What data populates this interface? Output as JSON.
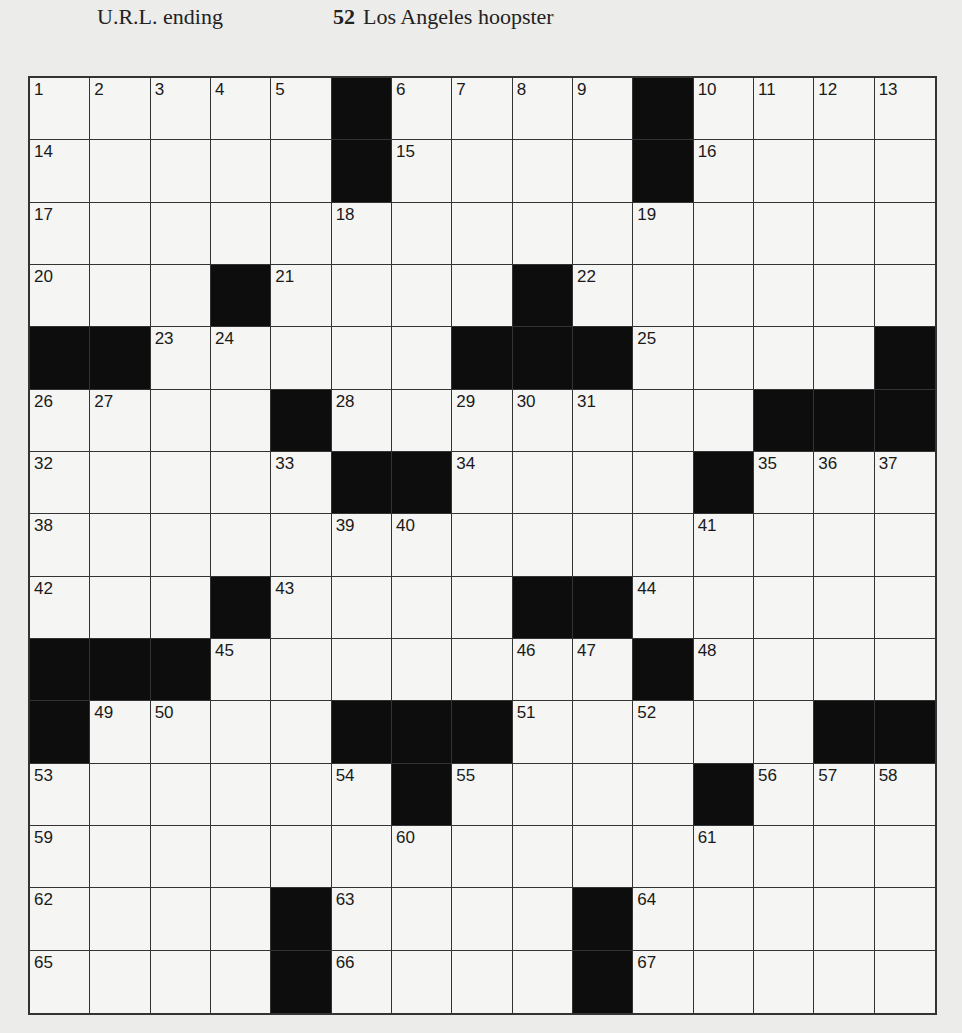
{
  "header": {
    "left_clue_text": "U.R.L. ending",
    "right_clue_number": "52",
    "right_clue_text": "Los Angeles hoopster"
  },
  "grid": {
    "rows": 15,
    "cols": 15,
    "layout": [
      ".....#....#....",
      ".....#....#....",
      "...............",
      "...#....#......",
      "##.....###.....#",
      "....#.......###",
      ".....##.....#...",
      "...............",
      "...#....##.....",
      "###.......#....",
      "#....###......##",
      "......#.....#...",
      "...............",
      "....#....#.....",
      "....#....#....."
    ],
    "numbers": [
      [
        1,
        2,
        3,
        4,
        5,
        0,
        6,
        7,
        8,
        9,
        0,
        10,
        11,
        12,
        13
      ],
      [
        14,
        0,
        0,
        0,
        0,
        0,
        15,
        0,
        0,
        0,
        0,
        16,
        0,
        0,
        0
      ],
      [
        17,
        0,
        0,
        0,
        0,
        18,
        0,
        0,
        0,
        0,
        19,
        0,
        0,
        0,
        0
      ],
      [
        20,
        0,
        0,
        0,
        21,
        0,
        0,
        0,
        0,
        22,
        0,
        0,
        0,
        0,
        0
      ],
      [
        0,
        0,
        23,
        24,
        0,
        0,
        0,
        0,
        0,
        0,
        25,
        0,
        0,
        0,
        0
      ],
      [
        26,
        27,
        0,
        0,
        0,
        28,
        0,
        29,
        30,
        31,
        0,
        0,
        0,
        0,
        0
      ],
      [
        32,
        0,
        0,
        0,
        33,
        0,
        0,
        34,
        0,
        0,
        0,
        0,
        35,
        36,
        37
      ],
      [
        38,
        0,
        0,
        0,
        0,
        39,
        40,
        0,
        0,
        0,
        0,
        41,
        0,
        0,
        0
      ],
      [
        42,
        0,
        0,
        0,
        43,
        0,
        0,
        0,
        0,
        0,
        44,
        0,
        0,
        0,
        0
      ],
      [
        0,
        0,
        0,
        45,
        0,
        0,
        0,
        0,
        46,
        47,
        0,
        48,
        0,
        0,
        0
      ],
      [
        0,
        49,
        50,
        0,
        0,
        0,
        0,
        0,
        51,
        0,
        52,
        0,
        0,
        0,
        0
      ],
      [
        53,
        0,
        0,
        0,
        0,
        54,
        0,
        55,
        0,
        0,
        0,
        0,
        56,
        57,
        58
      ],
      [
        59,
        0,
        0,
        0,
        0,
        0,
        60,
        0,
        0,
        0,
        0,
        61,
        0,
        0,
        0
      ],
      [
        62,
        0,
        0,
        0,
        0,
        63,
        0,
        0,
        0,
        0,
        64,
        0,
        0,
        0,
        0
      ],
      [
        65,
        0,
        0,
        0,
        0,
        66,
        0,
        0,
        0,
        0,
        67,
        0,
        0,
        0,
        0
      ]
    ]
  },
  "colors": {
    "black_square": "#0d0d0d",
    "white_square": "#f5f5f3",
    "grid_line": "#333333",
    "paper": "#ececea"
  }
}
